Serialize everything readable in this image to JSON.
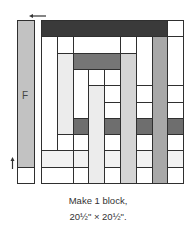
{
  "diagram": {
    "strip_label": "F",
    "caption_line1": "Make 1 block,",
    "caption_line2": "20½\" × 20½\".",
    "colors": {
      "dark": "#3a3a3a",
      "dark_medium": "#767676",
      "row_dark": "#6e6e6e",
      "medium": "#a8a8a8",
      "light": "#d4d4d4",
      "very_light": "#ececec",
      "faint": "#f2f2f2",
      "strip": "#c2c2c2",
      "white": "#ffffff",
      "line": "#2f2f2f"
    },
    "grid": {
      "columns": 9,
      "rows": 10,
      "col_width": 15.8,
      "row_height": 16.3,
      "pieces": [
        {
          "c": 0,
          "r": 0,
          "w": 8,
          "h": 1,
          "fill": "dark"
        },
        {
          "c": 8,
          "r": 0,
          "w": 1,
          "h": 1,
          "fill": "white"
        },
        {
          "c": 0,
          "r": 1,
          "w": 1,
          "h": 7,
          "fill": "white"
        },
        {
          "c": 1,
          "r": 1,
          "w": 1,
          "h": 1,
          "fill": "white"
        },
        {
          "c": 2,
          "r": 1,
          "w": 3,
          "h": 1,
          "fill": "white"
        },
        {
          "c": 5,
          "r": 1,
          "w": 1,
          "h": 1,
          "fill": "white"
        },
        {
          "c": 6,
          "r": 1,
          "w": 1,
          "h": 3,
          "fill": "white"
        },
        {
          "c": 7,
          "r": 1,
          "w": 1,
          "h": 9,
          "fill": "medium"
        },
        {
          "c": 8,
          "r": 1,
          "w": 1,
          "h": 3,
          "fill": "white"
        },
        {
          "c": 1,
          "r": 2,
          "w": 1,
          "h": 5,
          "fill": "very_light"
        },
        {
          "c": 2,
          "r": 2,
          "w": 3,
          "h": 1,
          "fill": "dark_medium"
        },
        {
          "c": 5,
          "r": 2,
          "w": 1,
          "h": 8,
          "fill": "light"
        },
        {
          "c": 2,
          "r": 3,
          "w": 1,
          "h": 3,
          "fill": "white"
        },
        {
          "c": 3,
          "r": 3,
          "w": 1,
          "h": 1,
          "fill": "white"
        },
        {
          "c": 4,
          "r": 3,
          "w": 1,
          "h": 1,
          "fill": "white"
        },
        {
          "c": 3,
          "r": 4,
          "w": 1,
          "h": 6,
          "fill": "very_light"
        },
        {
          "c": 4,
          "r": 4,
          "w": 1,
          "h": 1,
          "fill": "white"
        },
        {
          "c": 4,
          "r": 5,
          "w": 1,
          "h": 1,
          "fill": "white"
        },
        {
          "c": 6,
          "r": 4,
          "w": 1,
          "h": 1,
          "fill": "white"
        },
        {
          "c": 6,
          "r": 5,
          "w": 1,
          "h": 1,
          "fill": "white"
        },
        {
          "c": 8,
          "r": 4,
          "w": 1,
          "h": 1,
          "fill": "white"
        },
        {
          "c": 8,
          "r": 5,
          "w": 1,
          "h": 1,
          "fill": "white"
        },
        {
          "c": 2,
          "r": 6,
          "w": 1,
          "h": 1,
          "fill": "row_dark"
        },
        {
          "c": 4,
          "r": 6,
          "w": 1,
          "h": 1,
          "fill": "row_dark"
        },
        {
          "c": 6,
          "r": 6,
          "w": 1,
          "h": 1,
          "fill": "row_dark"
        },
        {
          "c": 8,
          "r": 6,
          "w": 1,
          "h": 1,
          "fill": "row_dark"
        },
        {
          "c": 1,
          "r": 7,
          "w": 1,
          "h": 1,
          "fill": "white"
        },
        {
          "c": 2,
          "r": 7,
          "w": 1,
          "h": 1,
          "fill": "white"
        },
        {
          "c": 4,
          "r": 7,
          "w": 1,
          "h": 1,
          "fill": "white"
        },
        {
          "c": 6,
          "r": 7,
          "w": 1,
          "h": 1,
          "fill": "white"
        },
        {
          "c": 8,
          "r": 7,
          "w": 1,
          "h": 1,
          "fill": "white"
        },
        {
          "c": 0,
          "r": 8,
          "w": 2,
          "h": 1,
          "fill": "faint"
        },
        {
          "c": 2,
          "r": 8,
          "w": 1,
          "h": 1,
          "fill": "faint"
        },
        {
          "c": 4,
          "r": 8,
          "w": 1,
          "h": 1,
          "fill": "faint"
        },
        {
          "c": 6,
          "r": 8,
          "w": 1,
          "h": 1,
          "fill": "faint"
        },
        {
          "c": 8,
          "r": 8,
          "w": 1,
          "h": 1,
          "fill": "faint"
        },
        {
          "c": 0,
          "r": 9,
          "w": 2,
          "h": 1,
          "fill": "white"
        },
        {
          "c": 2,
          "r": 9,
          "w": 1,
          "h": 1,
          "fill": "white"
        },
        {
          "c": 4,
          "r": 9,
          "w": 1,
          "h": 1,
          "fill": "white"
        },
        {
          "c": 6,
          "r": 9,
          "w": 1,
          "h": 1,
          "fill": "white"
        },
        {
          "c": 8,
          "r": 9,
          "w": 1,
          "h": 1,
          "fill": "white"
        }
      ]
    }
  }
}
